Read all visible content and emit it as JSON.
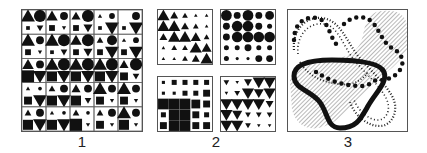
{
  "figure": {
    "labels": [
      "1",
      "2",
      "3"
    ],
    "colors": {
      "ink": "#111111",
      "frame": "#555555",
      "hatch": "#9a9a9a",
      "background": "#ffffff"
    }
  },
  "panel1": {
    "description": "5x5 grid; each cell has four symbols: triangle (top-left), circle (top-right), square (bottom-left), inverted triangle (bottom-right); sizes on 0-5 scale",
    "rows": [
      [
        [
          5,
          5,
          1,
          2
        ],
        [
          4,
          3,
          2,
          1
        ],
        [
          3,
          5,
          2,
          3
        ],
        [
          1,
          2,
          1,
          5
        ],
        [
          0,
          3,
          1,
          5
        ]
      ],
      [
        [
          5,
          3,
          2,
          1
        ],
        [
          5,
          5,
          1,
          2
        ],
        [
          4,
          5,
          2,
          3
        ],
        [
          2,
          4,
          2,
          5
        ],
        [
          1,
          2,
          2,
          5
        ]
      ],
      [
        [
          4,
          3,
          5,
          5
        ],
        [
          5,
          5,
          4,
          5
        ],
        [
          5,
          5,
          4,
          5
        ],
        [
          5,
          5,
          4,
          5
        ],
        [
          3,
          5,
          3,
          2
        ]
      ],
      [
        [
          1,
          1,
          3,
          5
        ],
        [
          2,
          3,
          4,
          5
        ],
        [
          3,
          3,
          4,
          2
        ],
        [
          5,
          3,
          3,
          1
        ],
        [
          5,
          3,
          3,
          1
        ]
      ],
      [
        [
          2,
          3,
          4,
          5
        ],
        [
          1,
          1,
          4,
          5
        ],
        [
          2,
          1,
          5,
          1
        ],
        [
          2,
          3,
          3,
          1
        ],
        [
          5,
          3,
          4,
          1
        ]
      ]
    ]
  },
  "panel2": {
    "subpanels": [
      {
        "symbol": "triangle",
        "rows": [
          [
            5,
            3,
            2,
            1,
            1
          ],
          [
            5,
            5,
            3,
            2,
            1
          ],
          [
            3,
            5,
            5,
            4,
            2
          ],
          [
            1,
            2,
            2,
            5,
            4
          ],
          [
            1,
            1,
            2,
            3,
            5
          ]
        ]
      },
      {
        "symbol": "circle",
        "rows": [
          [
            5,
            3,
            5,
            3,
            4
          ],
          [
            3,
            5,
            5,
            3,
            2
          ],
          [
            3,
            5,
            5,
            5,
            5
          ],
          [
            2,
            2,
            3,
            2,
            2
          ],
          [
            2,
            1,
            1,
            3,
            3
          ]
        ]
      },
      {
        "symbol": "square",
        "rows": [
          [
            1,
            2,
            2,
            2,
            2
          ],
          [
            1,
            1,
            2,
            2,
            3
          ],
          [
            5,
            5,
            5,
            4,
            3
          ],
          [
            2,
            5,
            5,
            3,
            2
          ],
          [
            3,
            5,
            5,
            3,
            3
          ]
        ]
      },
      {
        "symbol": "inverted-triangle",
        "rows": [
          [
            2,
            1,
            3,
            5,
            5
          ],
          [
            1,
            2,
            5,
            4,
            5
          ],
          [
            5,
            5,
            5,
            5,
            3
          ],
          [
            5,
            4,
            2,
            2,
            2
          ],
          [
            5,
            5,
            2,
            1,
            1
          ]
        ]
      }
    ]
  },
  "panel3": {
    "description": "Overlay of regions: hatched areas, large-dot trails, small-dot bands, and a thick black outlined region"
  }
}
